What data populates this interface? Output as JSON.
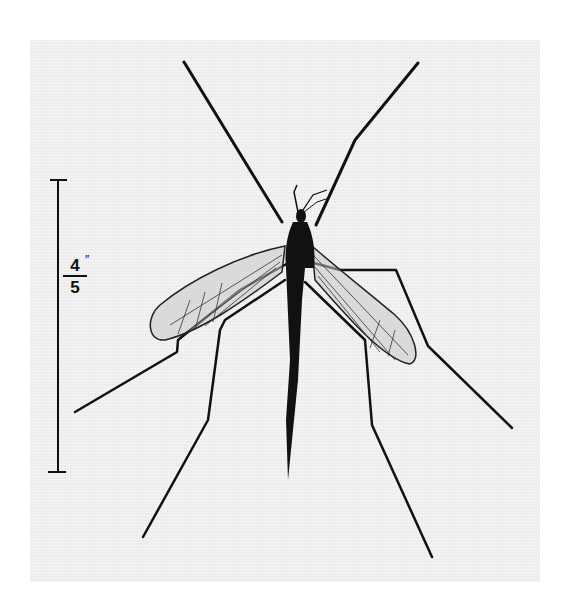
{
  "figure": {
    "background_color": "#ececec",
    "subject_color": "#111111",
    "scale_bar": {
      "numerator": "4",
      "denominator": "5",
      "unit_mark": "″",
      "label": "4/5″"
    }
  }
}
